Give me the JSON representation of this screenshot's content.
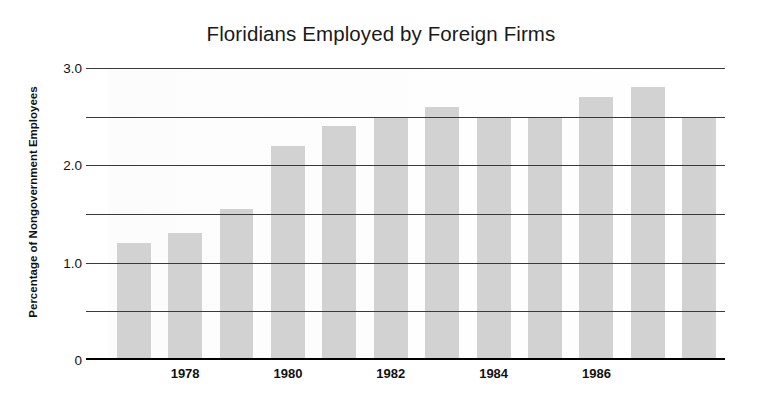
{
  "chart_data": {
    "type": "bar",
    "title": "Floridians Employed by Foreign Firms",
    "xlabel": "",
    "ylabel": "Percentage of Nongovernment Employees",
    "categories": [
      "1977",
      "1978",
      "1979",
      "1980",
      "1981",
      "1982",
      "1983",
      "1984",
      "1985",
      "1986",
      "1987",
      "1988"
    ],
    "values": [
      1.2,
      1.3,
      1.55,
      2.2,
      2.4,
      2.5,
      2.6,
      2.5,
      2.5,
      2.7,
      2.8,
      2.5
    ],
    "visible_xtick_labels": [
      "1978",
      "1980",
      "1982",
      "1984",
      "1986"
    ],
    "ytick_labels": [
      "3.0",
      "",
      "2.0",
      "",
      "1.0",
      "",
      "0"
    ],
    "ytick_values": [
      3.0,
      2.5,
      2.0,
      1.5,
      1.0,
      0.5,
      0
    ],
    "ylim": [
      0,
      3.0
    ],
    "grid": "horizontal",
    "legend": "none",
    "bar_color": "#d2d2d2",
    "axis_color": "#000000",
    "grid_color": "#3a3a3a",
    "background": "#ffffff"
  }
}
